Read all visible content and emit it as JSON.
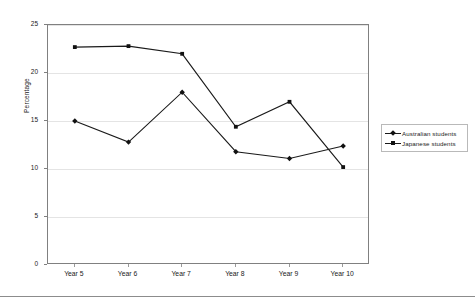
{
  "chart_data": {
    "type": "line",
    "title": "",
    "xlabel": "",
    "ylabel": "Percentage",
    "categories": [
      "Year 5",
      "Year 6",
      "Year 7",
      "Year 8",
      "Year 9",
      "Year 10"
    ],
    "ylim": [
      0,
      25
    ],
    "yticks": [
      0,
      5,
      10,
      15,
      20,
      25
    ],
    "grid": "horizontal",
    "legend_position": "right",
    "series": [
      {
        "name": "Australian students",
        "marker": "diamond",
        "color": "#1a1a1a",
        "values": [
          15.0,
          12.8,
          18.0,
          11.8,
          11.1,
          12.4
        ]
      },
      {
        "name": "Japanese students",
        "marker": "square",
        "color": "#1a1a1a",
        "values": [
          22.7,
          22.8,
          22.0,
          14.4,
          17.0,
          10.2
        ]
      }
    ]
  },
  "legend": {
    "items": [
      {
        "label": "Australian students"
      },
      {
        "label": "Japanese students"
      }
    ]
  }
}
